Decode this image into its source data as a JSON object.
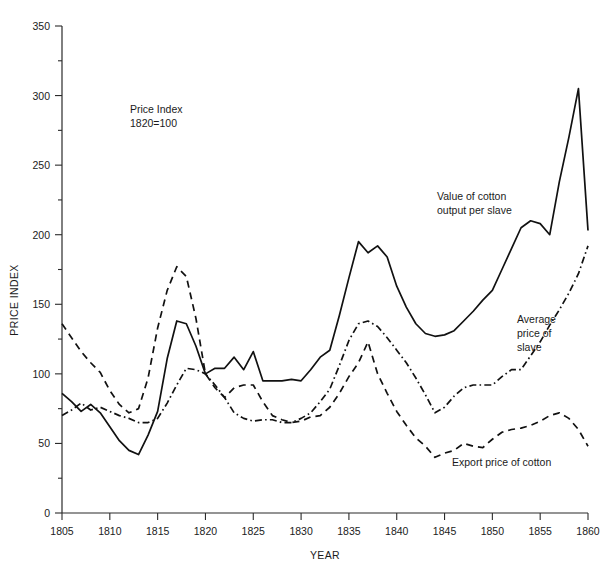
{
  "chart_data": {
    "type": "line",
    "title": "",
    "annotation_note": "Price Index\n1820=100",
    "note_line1": "Price Index",
    "note_line2": "1820=100",
    "xlabel": "YEAR",
    "ylabel": "PRICE INDEX",
    "xlim": [
      1805,
      1860
    ],
    "ylim": [
      0,
      350
    ],
    "yticks": [
      0,
      50,
      100,
      150,
      200,
      250,
      300,
      350
    ],
    "ytick_labels": [
      "0",
      "50",
      "100",
      "150",
      "200",
      "250",
      "300",
      "350"
    ],
    "yminor_step": 25,
    "xticks": [
      1805,
      1810,
      1815,
      1820,
      1825,
      1830,
      1835,
      1840,
      1845,
      1850,
      1855,
      1860
    ],
    "xtick_labels": [
      "1805",
      "1810",
      "1815",
      "1820",
      "1825",
      "1830",
      "1835",
      "1840",
      "1845",
      "1850",
      "1855",
      "1860"
    ],
    "grid": false,
    "legend": "inline-annotations",
    "line_color": "#111111",
    "x": [
      1805,
      1806,
      1807,
      1808,
      1809,
      1810,
      1811,
      1812,
      1813,
      1814,
      1815,
      1816,
      1817,
      1818,
      1819,
      1820,
      1821,
      1822,
      1823,
      1824,
      1825,
      1826,
      1827,
      1828,
      1829,
      1830,
      1831,
      1832,
      1833,
      1834,
      1835,
      1836,
      1837,
      1838,
      1839,
      1840,
      1841,
      1842,
      1843,
      1844,
      1845,
      1846,
      1847,
      1848,
      1849,
      1850,
      1851,
      1852,
      1853,
      1854,
      1855,
      1856,
      1857,
      1858,
      1859,
      1860
    ],
    "series": [
      {
        "name": "Value of cotton output per slave",
        "style": "solid",
        "label_line1": "Value of cotton",
        "label_line2": "output per slave",
        "values": [
          86,
          80,
          73,
          78,
          72,
          62,
          52,
          45,
          42,
          56,
          73,
          111,
          138,
          136,
          120,
          100,
          104,
          104,
          112,
          103,
          116,
          95,
          95,
          95,
          96,
          95,
          103,
          112,
          117,
          142,
          169,
          195,
          187,
          192,
          184,
          163,
          148,
          136,
          129,
          127,
          128,
          131,
          138,
          145,
          153,
          160,
          175,
          190,
          205,
          210,
          208,
          200,
          238,
          270,
          305,
          203
        ]
      },
      {
        "name": "Average price of slave",
        "style": "dashdot",
        "label_line1": "Average",
        "label_line2": "price of",
        "label_line3": "slave",
        "values": [
          70,
          74,
          79,
          74,
          76,
          73,
          70,
          68,
          65,
          65,
          68,
          79,
          92,
          104,
          103,
          100,
          92,
          83,
          72,
          68,
          66,
          67,
          67,
          65,
          65,
          68,
          72,
          80,
          89,
          106,
          124,
          136,
          138,
          134,
          126,
          117,
          108,
          97,
          85,
          72,
          76,
          84,
          90,
          92,
          92,
          92,
          98,
          103,
          103,
          113,
          123,
          135,
          146,
          158,
          172,
          192
        ]
      },
      {
        "name": "Export price of cotton",
        "style": "dashed",
        "label": "Export price of cotton",
        "values": [
          136,
          126,
          116,
          108,
          101,
          88,
          78,
          72,
          75,
          97,
          133,
          160,
          177,
          170,
          140,
          100,
          90,
          83,
          90,
          92,
          92,
          80,
          70,
          67,
          65,
          66,
          69,
          70,
          76,
          86,
          98,
          108,
          123,
          100,
          86,
          73,
          63,
          54,
          48,
          40,
          43,
          45,
          50,
          48,
          47,
          53,
          58,
          60,
          61,
          63,
          66,
          70,
          72,
          68,
          60,
          48
        ]
      }
    ]
  }
}
